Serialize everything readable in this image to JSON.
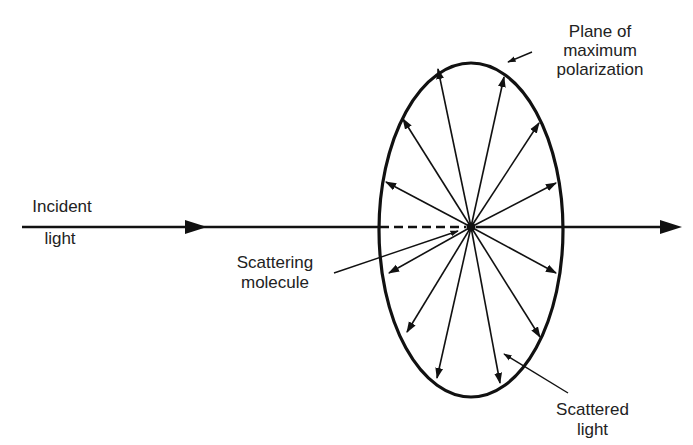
{
  "labels": {
    "incident": [
      "Incident",
      "light"
    ],
    "plane": [
      "Plane of",
      "maximum",
      "polarization"
    ],
    "molecule": [
      "Scattering",
      "molecule"
    ],
    "scattered": [
      "Scattered",
      "light"
    ]
  },
  "geometry": {
    "center": [
      471,
      227
    ],
    "ellipse": {
      "cx": 471,
      "cy": 230,
      "rx": 92,
      "ry": 167
    },
    "axis": {
      "x1": 22,
      "x2": 680,
      "y": 227
    },
    "incident_arrow_tip": [
      205,
      227
    ],
    "dashed": {
      "x1": 380,
      "x2": 468
    },
    "scatter_tips": [
      [
        438,
        69
      ],
      [
        504,
        77
      ],
      [
        403,
        119
      ],
      [
        539,
        123
      ],
      [
        386,
        182
      ],
      [
        556,
        183
      ],
      [
        389,
        273
      ],
      [
        556,
        273
      ],
      [
        407,
        332
      ],
      [
        540,
        337
      ],
      [
        437,
        378
      ],
      [
        500,
        383
      ]
    ]
  },
  "colors": {
    "line": "#111111",
    "background": "#ffffff"
  }
}
